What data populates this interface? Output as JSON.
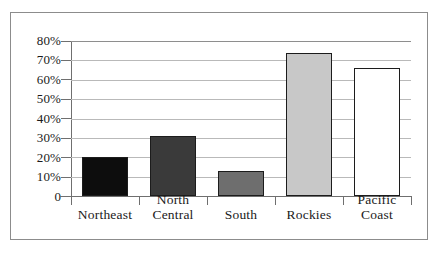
{
  "chart_data": {
    "type": "bar",
    "title": "",
    "subtitle": "",
    "xlabel": "",
    "ylabel": "",
    "categories": [
      "Northeast",
      "North Central",
      "South",
      "Rockies",
      "Pacific Coast"
    ],
    "category_lines": [
      [
        "Northeast"
      ],
      [
        "North",
        "Central"
      ],
      [
        "South"
      ],
      [
        "Rockies"
      ],
      [
        "Pacific",
        "Coast"
      ]
    ],
    "values": [
      20,
      31,
      13,
      74,
      66
    ],
    "value_unit": "%",
    "series": [
      {
        "name": "Percent",
        "values": [
          20,
          31,
          13,
          74,
          66
        ]
      }
    ],
    "bar_colors": [
      "#0d0d0d",
      "#3a3a3a",
      "#6e6e6e",
      "#c8c8c8",
      "#ffffff"
    ],
    "bar_edge_color": "#1c1c1c",
    "ylim": [
      0,
      80
    ],
    "ytick_values": [
      0,
      10,
      20,
      30,
      40,
      50,
      60,
      70,
      80
    ],
    "ytick_labels": [
      "0",
      "10%",
      "20%",
      "30%",
      "40%",
      "50%",
      "60%",
      "70%",
      "80%"
    ],
    "grid": true,
    "grid_axis": "y",
    "grid_color": "#b9b9b9",
    "legend": false,
    "legend_position": "none",
    "axis_color": "#6f6f6f",
    "frame_color": "#8c8c8c",
    "background_color": "#ffffff"
  }
}
